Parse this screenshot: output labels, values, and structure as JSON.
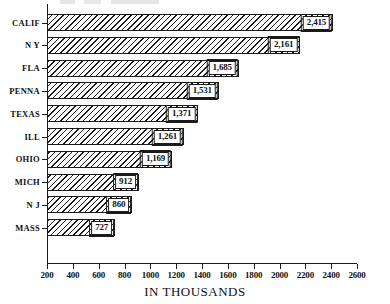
{
  "chart_data": {
    "type": "bar",
    "orientation": "horizontal",
    "title": "",
    "xlabel": "IN THOUSANDS",
    "ylabel": "",
    "xlim": [
      200,
      2600
    ],
    "xticks": [
      200,
      400,
      600,
      800,
      1000,
      1200,
      1400,
      1600,
      1800,
      2000,
      2200,
      2400,
      2600
    ],
    "grid": false,
    "legend": null,
    "categories": [
      "CALIF",
      "N Y",
      "FLA",
      "PENNA",
      "TEXAS",
      "ILL",
      "OHIO",
      "MICH",
      "N J",
      "MASS"
    ],
    "values": [
      2415,
      2161,
      1685,
      1531,
      1371,
      1261,
      1169,
      912,
      860,
      727
    ],
    "value_labels": [
      "2,415",
      "2,161",
      "1,685",
      "1,531",
      "1,371",
      "1,261",
      "1,169",
      "912",
      "860",
      "727"
    ],
    "bar_style": "diagonal-hatch"
  },
  "axis": {
    "x_title": "IN THOUSANDS",
    "tick_labels": [
      "200",
      "400",
      "600",
      "800",
      "1000",
      "1200",
      "1400",
      "1600",
      "1800",
      "2000",
      "2200",
      "2400",
      "2600"
    ]
  },
  "rows": [
    {
      "category": "CALIF",
      "value": 2415,
      "label": "2,415"
    },
    {
      "category": "N Y",
      "value": 2161,
      "label": "2,161"
    },
    {
      "category": "FLA",
      "value": 1685,
      "label": "1,685"
    },
    {
      "category": "PENNA",
      "value": 1531,
      "label": "1,531"
    },
    {
      "category": "TEXAS",
      "value": 1371,
      "label": "1,371"
    },
    {
      "category": "ILL",
      "value": 1261,
      "label": "1,261"
    },
    {
      "category": "OHIO",
      "value": 1169,
      "label": "1,169"
    },
    {
      "category": "MICH",
      "value": 912,
      "label": "912"
    },
    {
      "category": "N J",
      "value": 860,
      "label": "860"
    },
    {
      "category": "MASS",
      "value": 727,
      "label": "727"
    }
  ],
  "colors": {
    "ink": "#1a1a1a",
    "background": "#ffffff"
  }
}
